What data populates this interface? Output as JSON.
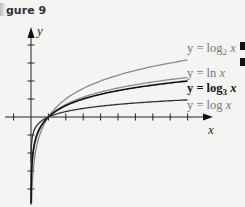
{
  "figure_label": "gure 9",
  "chart_data": {
    "type": "line",
    "title": "",
    "xlabel": "x",
    "ylabel": "y",
    "xlim": [
      -1.6,
      10.2
    ],
    "ylim": [
      -4.8,
      5.0
    ],
    "x_ticks": [
      -1,
      1,
      2,
      3,
      4,
      5,
      6,
      7,
      8,
      9
    ],
    "y_ticks": [
      -4,
      -3,
      -2,
      -1,
      1,
      2,
      3,
      4
    ],
    "grid": false,
    "series": [
      {
        "name": "log2",
        "label_prefix": "y = log",
        "label_sub": "2",
        "label_suffix": " x",
        "base": 2,
        "color": "#8a8a8a",
        "bold": false
      },
      {
        "name": "ln",
        "label_prefix": "y = ln x",
        "label_sub": "",
        "label_suffix": "",
        "base": 2.718281828,
        "color": "#8a8a8a",
        "bold": false
      },
      {
        "name": "log3",
        "label_prefix": "y = log",
        "label_sub": "3",
        "label_suffix": " x",
        "base": 3,
        "color": "#111111",
        "bold": true
      },
      {
        "name": "log10",
        "label_prefix": "y = log x",
        "label_sub": "",
        "label_suffix": "",
        "base": 10,
        "color": "#333333",
        "bold": false
      }
    ]
  }
}
